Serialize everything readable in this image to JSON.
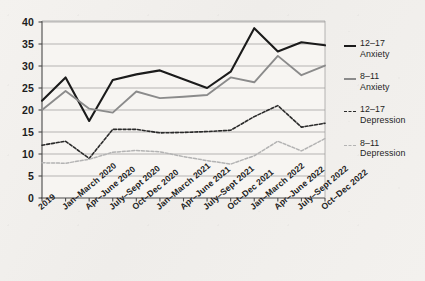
{
  "chart_data": {
    "type": "line",
    "title": "",
    "subtitle": "",
    "xlabel": "",
    "ylabel": "",
    "ylim": [
      0,
      40
    ],
    "yticks": [
      0,
      5,
      10,
      15,
      20,
      25,
      30,
      35,
      40
    ],
    "grid": true,
    "legend_position": "right",
    "categories": [
      "2019",
      "Jan–March 2020",
      "Apr–June 2020",
      "July–Sept 2020",
      "Oct–Dec 2020",
      "Jan–March 2021",
      "Apr–June 2021",
      "July–Sept 2021",
      "Oct–Dec 2021",
      "Jan–March 2022",
      "Apr–June 2022",
      "July–Sept 2022",
      "Oct–Dec 2022"
    ],
    "series": [
      {
        "name": "12–17 Anxiety",
        "label_line1": "12–17",
        "label_line2": "Anxiety",
        "color": "#1b1b1b",
        "style": "solid",
        "width": 2.1,
        "values": [
          22.1,
          27.4,
          17.5,
          26.8,
          28.1,
          29.0,
          27.0,
          25.0,
          28.7,
          38.6,
          33.3,
          35.4,
          34.7
        ]
      },
      {
        "name": "8–11 Anxiety",
        "label_line1": "8–11",
        "label_line2": "Anxiety",
        "color": "#8b8b8b",
        "style": "solid",
        "width": 1.9,
        "values": [
          20.0,
          24.3,
          20.3,
          19.4,
          24.2,
          22.7,
          23.0,
          23.4,
          27.4,
          26.3,
          32.3,
          27.9,
          30.1
        ]
      },
      {
        "name": "12–17 Depression",
        "label_line1": "12–17",
        "label_line2": "Depression",
        "color": "#2a2a2a",
        "style": "dashed",
        "width": 1.6,
        "values": [
          12.0,
          12.9,
          9.0,
          15.6,
          15.6,
          14.8,
          14.9,
          15.1,
          15.4,
          18.5,
          21.0,
          16.1,
          17.0
        ]
      },
      {
        "name": "8–11 Depression",
        "label_line1": "8–11",
        "label_line2": "Depression",
        "color": "#b3b3b3",
        "style": "dashed",
        "width": 1.5,
        "values": [
          8.0,
          7.9,
          8.8,
          10.4,
          10.8,
          10.5,
          9.4,
          8.5,
          7.7,
          9.6,
          12.9,
          10.7,
          13.5
        ]
      }
    ]
  },
  "axis": {
    "y_labels": [
      "40",
      "35",
      "30",
      "25",
      "20",
      "15",
      "10",
      "5",
      "0"
    ]
  },
  "colors": {
    "background": "#f2f0ed",
    "plot_background": "#f7f5f2",
    "grid": "#9a9a9a",
    "axis": "#4a4a4a",
    "text": "#1d1d1d"
  }
}
